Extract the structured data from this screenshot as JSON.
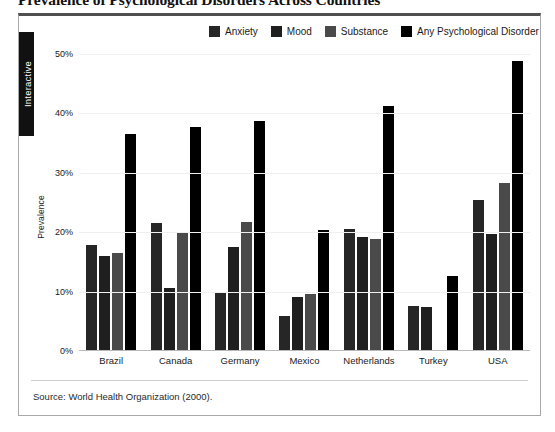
{
  "page_title": "Prevalence of Psychological Disorders Across Countries",
  "side_tab": {
    "label": "Interactive"
  },
  "source": {
    "text": "Source: World Health Organization (2000)."
  },
  "colors": {
    "anxiety": "#262626",
    "mood": "#1f1f1f",
    "substance": "#4a4a4a",
    "any": "#000000",
    "grid": "#efefef",
    "axis": "#b9b9b9",
    "panel_border": "#a9a9a9",
    "panel_top_border": "#4f4f4f",
    "tab_background": "#111111",
    "tab_text": "#ffffff"
  },
  "chart_data": {
    "type": "bar",
    "title": "Prevalence of Psychological Disorders Across Countries",
    "xlabel": "",
    "ylabel": "Prevalence",
    "ylim": [
      0,
      50
    ],
    "ytick_values": [
      0,
      10,
      20,
      30,
      40,
      50
    ],
    "ytick_labels": [
      "0%",
      "10%",
      "20%",
      "30%",
      "40%",
      "50%"
    ],
    "grid": true,
    "legend_position": "top-right",
    "categories": [
      "Brazil",
      "Canada",
      "Germany",
      "Mexico",
      "Netherlands",
      "Turkey",
      "USA"
    ],
    "series": [
      {
        "name": "Anxiety",
        "color": "#262626",
        "values": [
          17.6,
          21.3,
          9.8,
          5.8,
          20.4,
          7.4,
          25.3
        ]
      },
      {
        "name": "Mood",
        "color": "#1f1f1f",
        "values": [
          15.8,
          10.4,
          17.4,
          8.9,
          19.0,
          7.3,
          19.6
        ]
      },
      {
        "name": "Substance",
        "color": "#4a4a4a",
        "values": [
          16.3,
          19.9,
          21.5,
          9.5,
          18.7,
          null,
          28.2
        ]
      },
      {
        "name": "Any Psychological Disorder",
        "color": "#000000",
        "values": [
          36.4,
          37.5,
          38.6,
          20.2,
          41.1,
          12.4,
          48.7
        ]
      }
    ]
  }
}
